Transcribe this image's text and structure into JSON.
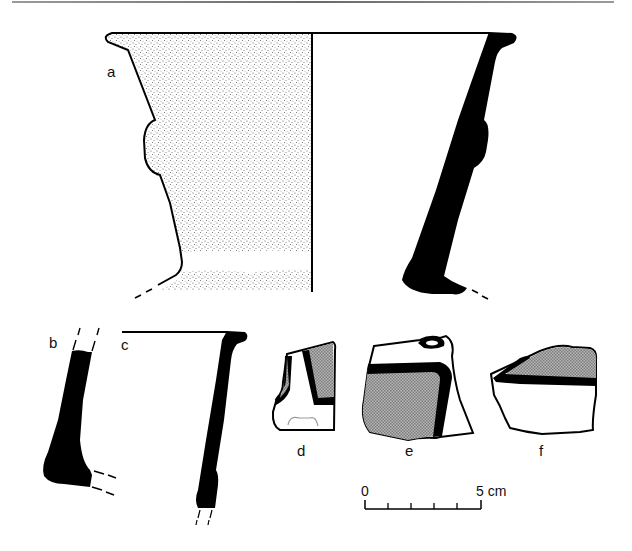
{
  "figure": {
    "type": "ceramic-profile-drawing",
    "colors": {
      "ink": "#000000",
      "stipple": "#b9b9b9",
      "paint_fill": "#9f9f9f",
      "background": "#ffffff"
    }
  },
  "labels": {
    "a": "a",
    "b": "b",
    "c": "c",
    "d": "d",
    "e": "e",
    "f": "f"
  },
  "scale_bar": {
    "start_label": "0",
    "end_label": "5 cm",
    "ticks": 6
  }
}
